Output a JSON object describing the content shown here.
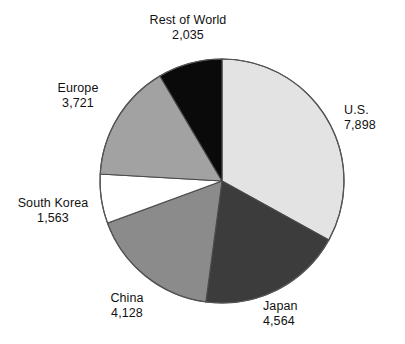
{
  "chart_data": {
    "type": "pie",
    "title": "",
    "subtitle": "",
    "xlabel": "",
    "ylabel": "",
    "legend_position": "none",
    "grid": false,
    "total": 23909,
    "start_angle_deg": 0,
    "direction": "clockwise",
    "categories": [
      "U.S.",
      "Japan",
      "China",
      "South Korea",
      "Europe",
      "Rest of World"
    ],
    "values": [
      7898,
      4564,
      4128,
      1563,
      3721,
      2035
    ],
    "value_labels": [
      "7,898",
      "4,564",
      "4,128",
      "1,563",
      "3,721",
      "2,035"
    ],
    "slices": [
      {
        "label": "U.S.",
        "value": 7898,
        "value_label": "7,898",
        "color": "#e3e3e3",
        "start_deg": 0,
        "end_deg": 118.9,
        "label_position": "right"
      },
      {
        "label": "Japan",
        "value": 4564,
        "value_label": "4,564",
        "color": "#3c3c3c",
        "start_deg": 118.9,
        "end_deg": 187.6,
        "label_position": "bottom-right"
      },
      {
        "label": "China",
        "value": 4128,
        "value_label": "4,128",
        "color": "#8b8b8b",
        "start_deg": 187.6,
        "end_deg": 249.8,
        "label_position": "bottom-left"
      },
      {
        "label": "South Korea",
        "value": 1563,
        "value_label": "1,563",
        "color": "#ffffff",
        "start_deg": 249.8,
        "end_deg": 273.3,
        "label_position": "left"
      },
      {
        "label": "Europe",
        "value": 3721,
        "value_label": "3,721",
        "color": "#a2a2a2",
        "start_deg": 273.3,
        "end_deg": 329.4,
        "label_position": "top-left"
      },
      {
        "label": "Rest of World",
        "value": 2035,
        "value_label": "2,035",
        "color": "#0a0a0a",
        "start_deg": 329.4,
        "end_deg": 360,
        "label_position": "top"
      }
    ],
    "geometry": {
      "center_x": 222,
      "center_y": 181,
      "radius": 122,
      "outline_color": "#555555"
    }
  },
  "labels": {
    "rest_of_world": {
      "name": "Rest of World",
      "value": "2,035"
    },
    "us": {
      "name": "U.S.",
      "value": "7,898"
    },
    "europe": {
      "name": "Europe",
      "value": "3,721"
    },
    "south_korea": {
      "name": "South Korea",
      "value": "1,563"
    },
    "china": {
      "name": "China",
      "value": "4,128"
    },
    "japan": {
      "name": "Japan",
      "value": "4,564"
    }
  }
}
